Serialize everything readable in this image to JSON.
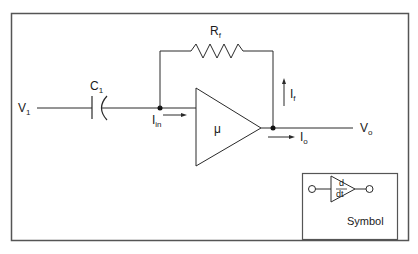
{
  "diagram": {
    "type": "circuit",
    "labels": {
      "input_voltage": "V",
      "input_voltage_sub": "1",
      "capacitor": "C",
      "capacitor_sub": "1",
      "feedback_resistor": "R",
      "feedback_resistor_sub": "f",
      "input_current": "I",
      "input_current_sub": "in",
      "feedback_current": "I",
      "feedback_current_sub": "f",
      "gain": "μ",
      "output_current": "I",
      "output_current_sub": "o",
      "output_voltage": "V",
      "output_voltage_sub": "o"
    },
    "symbol_box": {
      "numerator": "d",
      "denominator": "dt",
      "caption": "Symbol"
    },
    "colors": {
      "line": "#2a2a2a",
      "frame": "#555555",
      "background": "#ffffff"
    }
  }
}
